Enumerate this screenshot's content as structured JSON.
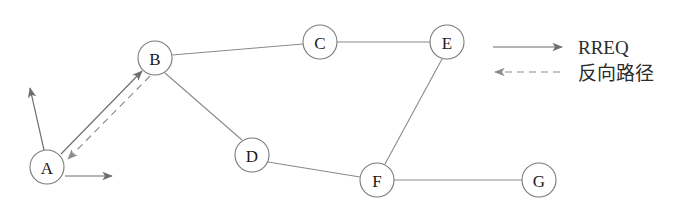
{
  "diagram": {
    "type": "network-routing-diagram",
    "background_color": "#ffffff",
    "node_stroke_color": "#7a7a7a",
    "edge_color": "#8a8a8a",
    "arrow_color": "#6e6e6e",
    "label_color": "#1a1a1a",
    "nodes": [
      {
        "id": "A",
        "label": "A",
        "cx": 47,
        "cy": 167,
        "r": 17
      },
      {
        "id": "B",
        "label": "B",
        "cx": 155,
        "cy": 58,
        "r": 17
      },
      {
        "id": "C",
        "label": "C",
        "cx": 320,
        "cy": 42,
        "r": 17
      },
      {
        "id": "D",
        "label": "D",
        "cx": 252,
        "cy": 155,
        "r": 17
      },
      {
        "id": "E",
        "label": "E",
        "cx": 447,
        "cy": 42,
        "r": 17
      },
      {
        "id": "F",
        "label": "F",
        "cx": 377,
        "cy": 180,
        "r": 17
      },
      {
        "id": "G",
        "label": "G",
        "cx": 539,
        "cy": 180,
        "r": 17
      }
    ],
    "edges": [
      {
        "from": "B",
        "to": "C",
        "x1": 172,
        "y1": 55,
        "x2": 303,
        "y2": 44
      },
      {
        "from": "C",
        "to": "E",
        "x1": 337,
        "y1": 42,
        "x2": 430,
        "y2": 42
      },
      {
        "from": "B",
        "to": "D",
        "x1": 165,
        "y1": 73,
        "x2": 242,
        "y2": 140
      },
      {
        "from": "D",
        "to": "F",
        "x1": 268,
        "y1": 162,
        "x2": 360,
        "y2": 177
      },
      {
        "from": "E",
        "to": "F",
        "x1": 442,
        "y1": 59,
        "x2": 385,
        "y2": 164
      },
      {
        "from": "F",
        "to": "G",
        "x1": 394,
        "y1": 180,
        "x2": 522,
        "y2": 180
      }
    ],
    "rreq_arrows": [
      {
        "name": "a-to-upper-left",
        "x1": 44,
        "y1": 150,
        "x2": 30,
        "y2": 88
      },
      {
        "name": "a-to-b-forward",
        "x1": 61,
        "y1": 154,
        "x2": 142,
        "y2": 71
      },
      {
        "name": "a-to-right",
        "x1": 65,
        "y1": 176,
        "x2": 112,
        "y2": 176
      }
    ],
    "reverse_arrows": [
      {
        "name": "b-to-a-reverse",
        "x1": 150,
        "y1": 76,
        "x2": 68,
        "y2": 159
      }
    ],
    "legend": {
      "items": [
        {
          "key": "rreq",
          "label": "RREQ",
          "style": "solid",
          "direction": "right",
          "line": {
            "x1": 493,
            "y1": 47,
            "x2": 562,
            "y2": 47
          },
          "text_x": 578,
          "text_y": 47
        },
        {
          "key": "reverse-path",
          "label": "反向路径",
          "style": "dashed",
          "direction": "left",
          "line": {
            "x1": 560,
            "y1": 72,
            "x2": 495,
            "y2": 72
          },
          "text_x": 578,
          "text_y": 73
        }
      ]
    }
  }
}
